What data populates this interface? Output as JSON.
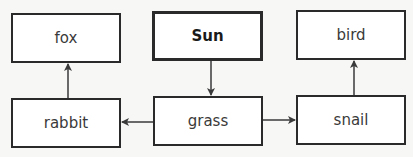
{
  "diagram": {
    "type": "food-chain",
    "nodes": [
      {
        "id": "fox",
        "label": "fox",
        "emphasis": false
      },
      {
        "id": "sun",
        "label": "Sun",
        "emphasis": true
      },
      {
        "id": "bird",
        "label": "bird",
        "emphasis": false
      },
      {
        "id": "rabbit",
        "label": "rabbit",
        "emphasis": false
      },
      {
        "id": "grass",
        "label": "grass",
        "emphasis": false
      },
      {
        "id": "snail",
        "label": "snail",
        "emphasis": false
      }
    ],
    "edges": [
      {
        "from": "sun",
        "to": "grass"
      },
      {
        "from": "grass",
        "to": "rabbit"
      },
      {
        "from": "grass",
        "to": "snail"
      },
      {
        "from": "rabbit",
        "to": "fox"
      },
      {
        "from": "snail",
        "to": "bird"
      }
    ],
    "colors": {
      "border": "#2a2a2a",
      "arrow": "#3a3a3a",
      "background": "#f7f7f5"
    }
  }
}
